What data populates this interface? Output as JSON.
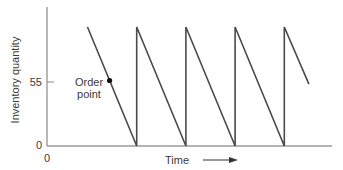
{
  "chart_data": {
    "type": "line",
    "title": "",
    "xlabel": "Time",
    "ylabel": "Inventory quantity",
    "x_origin_label": "0",
    "y_tick_labels": [
      "0",
      "55"
    ],
    "y_ticks": [
      0,
      55
    ],
    "annotation": {
      "label_line1": "Order",
      "label_line2": "point",
      "y": 55
    },
    "series": [
      {
        "name": "Inventory level",
        "shape": "sawtooth",
        "points": [
          {
            "t": 0.0,
            "q": 100
          },
          {
            "t": 1.0,
            "q": 0
          },
          {
            "t": 1.0,
            "q": 100
          },
          {
            "t": 2.0,
            "q": 0
          },
          {
            "t": 2.0,
            "q": 100
          },
          {
            "t": 3.0,
            "q": 0
          },
          {
            "t": 3.0,
            "q": 100
          },
          {
            "t": 4.0,
            "q": 0
          },
          {
            "t": 4.0,
            "q": 100
          },
          {
            "t": 4.5,
            "q": 52
          }
        ]
      }
    ],
    "ylim": [
      0,
      117
    ],
    "grid": false,
    "legend": "none"
  },
  "layout": {
    "axis_color": "#9a9a9a",
    "line_color": "#4a4a4a"
  }
}
